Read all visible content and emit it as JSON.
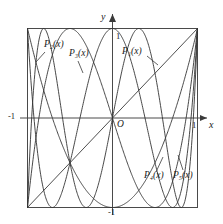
{
  "chart_data": {
    "type": "line",
    "title": "",
    "subtitle": "",
    "xlabel": "x",
    "ylabel": "y",
    "xlim": [
      -1,
      1
    ],
    "ylim": [
      -1,
      1
    ],
    "grid": false,
    "legend_position": "inline-annotations",
    "x_ticks": [
      "-1",
      "1"
    ],
    "y_ticks": [
      "1",
      "-1"
    ],
    "origin_label": "O",
    "frame": true,
    "series": [
      {
        "name": "P1(x)",
        "label": "P₁(x)",
        "degree": 1,
        "color": "#333333",
        "formula": "x",
        "endpoints": [
          [
            -1,
            -1
          ],
          [
            1,
            1
          ]
        ],
        "extrema_count": 0
      },
      {
        "name": "P2(x)",
        "label": "P₂(x)",
        "degree": 2,
        "color": "#333333",
        "formula": "2x^2 - 1",
        "endpoints": [
          [
            -1,
            1
          ],
          [
            1,
            1
          ]
        ],
        "extrema_count": 1
      },
      {
        "name": "P3(x)",
        "label": "P₃(x)",
        "degree": 3,
        "color": "#333333",
        "formula": "4x^3 - 3x",
        "endpoints": [
          [
            -1,
            -1
          ],
          [
            1,
            1
          ]
        ],
        "extrema_count": 2
      },
      {
        "name": "P4(x)",
        "label": "P₄(x)",
        "degree": 4,
        "color": "#333333",
        "formula": "8x^4 - 8x^2 + 1",
        "endpoints": [
          [
            -1,
            1
          ],
          [
            1,
            1
          ]
        ],
        "extrema_count": 3
      },
      {
        "name": "P5(x)",
        "label": "P₅(x)",
        "degree": 5,
        "color": "#333333",
        "formula": "16x^5 - 20x^3 + 5x",
        "endpoints": [
          [
            -1,
            -1
          ],
          [
            1,
            1
          ]
        ],
        "extrema_count": 4
      }
    ],
    "annotations": [
      {
        "id": "p2",
        "text": "P₂(x)",
        "x_px": 46,
        "y_px": 43
      },
      {
        "id": "p3",
        "text": "P₃(x)",
        "x_px": 71,
        "y_px": 52
      },
      {
        "id": "p1",
        "text": "P₁(x)",
        "x_px": 124,
        "y_px": 50
      },
      {
        "id": "p4",
        "text": "P₄(x)",
        "x_px": 146,
        "y_px": 174
      },
      {
        "id": "p5",
        "text": "P₅(x)",
        "x_px": 175,
        "y_px": 174
      }
    ]
  }
}
